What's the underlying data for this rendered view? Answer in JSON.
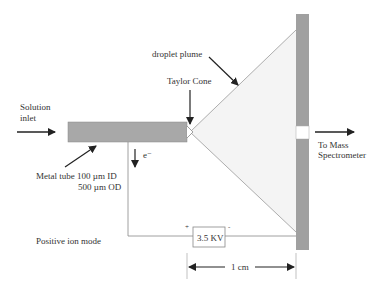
{
  "labels": {
    "solution_inlet_1": "Solution",
    "solution_inlet_2": "inlet",
    "droplet_plume": "droplet plume",
    "taylor_cone": "Taylor Cone",
    "metal_tube_1": "Metal tube 100 µm ID",
    "metal_tube_2": "500 µm OD",
    "electron": "e⁻",
    "to_ms_1": "To Mass",
    "to_ms_2": "Spectrometer",
    "mode": "Positive ion mode",
    "voltage": "3.5 KV",
    "plus": "+",
    "minus": "-",
    "distance": "1 cm"
  },
  "colors": {
    "tube": "#a8a8a8",
    "plate": "#a0a0a0",
    "plume": "#f4f4f4",
    "line": "#555555",
    "arrow": "#222222"
  }
}
